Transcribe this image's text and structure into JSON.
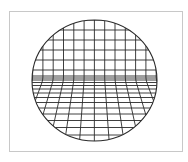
{
  "diagram": {
    "title": "",
    "colors": {
      "background": "#ffffff",
      "frame": "#c8c8c8",
      "line": "#2a2a2a"
    },
    "frame": {
      "x": 9.5,
      "y": 11.5,
      "width": 173,
      "height": 140
    },
    "ellipse": {
      "cx": 94.5,
      "cy": 80.5,
      "rx": 62.5,
      "ry": 60.5
    },
    "wall": {
      "vertical_x": [
        12,
        22.3,
        32.6,
        42.9,
        53.2,
        63.5,
        73.8,
        84.1,
        94.4,
        104.7,
        115,
        125.3,
        135.6,
        145.9,
        156.2,
        166.5
      ],
      "horizontal_y": [
        20,
        30,
        40,
        50,
        60,
        70,
        76
      ]
    },
    "horizon_y": 80,
    "floor": {
      "horizontal_y": [
        78,
        80,
        82.5,
        85.5,
        89,
        93,
        97.5,
        102.5,
        108,
        114,
        120.5,
        127.5,
        135,
        143
      ],
      "vanishing_point": {
        "x": 94.5,
        "y": -60
      }
    }
  }
}
